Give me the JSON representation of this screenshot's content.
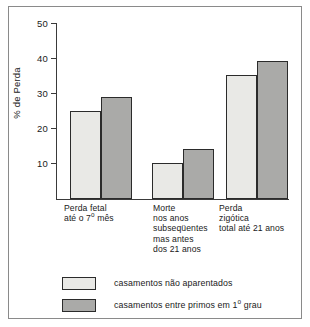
{
  "chart_data": {
    "type": "bar",
    "title": "",
    "subtitle": "",
    "xlabel": "",
    "ylabel": "% de Perda",
    "ylim": [
      0,
      50
    ],
    "yticks": [
      10,
      20,
      30,
      40,
      50
    ],
    "ytick_labels": [
      "10",
      "20",
      "30",
      "40",
      "50"
    ],
    "grid": false,
    "legend_position": "bottom-left",
    "categories": [
      "Perda fetal\naté o 7º mês",
      "Morte\nnos anos\nsubseqüentes\nmas antes\ndos 21 anos",
      "Perda\nzigótica\ntotal até 21 anos"
    ],
    "series": [
      {
        "name": "casamentos não aparentados",
        "color": "#e9e9e6",
        "values": [
          25.1,
          10.1,
          35.4
        ]
      },
      {
        "name": "casamentos entre primos em 1º grau",
        "color": "#aaaaa8",
        "values": [
          29.1,
          14.2,
          39.4
        ]
      }
    ],
    "annotations": []
  },
  "axis": {
    "y_title": "% de Perda",
    "ticks": [
      {
        "label": "50",
        "value": 50
      },
      {
        "label": "40",
        "value": 40
      },
      {
        "label": "30",
        "value": 30
      },
      {
        "label": "20",
        "value": 20
      },
      {
        "label": "10",
        "value": 10
      }
    ]
  },
  "categories": [
    {
      "id": "perda-fetal",
      "label": "Perda fetal\naté o 7º mês"
    },
    {
      "id": "morte-subsequente",
      "label": "Morte\nnos anos\nsubseqüentes\nmas antes\ndos 21 anos"
    },
    {
      "id": "perda-zigotica",
      "label": "Perda\nzigótica\ntotal até 21 anos"
    }
  ],
  "bars": [
    {
      "id": "perda-fetal-nao-aparentados",
      "group": 0,
      "series": 0,
      "value": 25.1,
      "x": 70,
      "width": 31
    },
    {
      "id": "perda-fetal-primos",
      "group": 0,
      "series": 1,
      "value": 29.1,
      "x": 101,
      "width": 31
    },
    {
      "id": "morte-nao-aparentados",
      "group": 1,
      "series": 0,
      "value": 10.1,
      "x": 152,
      "width": 31
    },
    {
      "id": "morte-primos",
      "group": 1,
      "series": 1,
      "value": 14.2,
      "x": 183,
      "width": 31
    },
    {
      "id": "zigotica-nao-aparentados",
      "group": 2,
      "series": 0,
      "value": 35.4,
      "x": 226,
      "width": 31
    },
    {
      "id": "zigotica-primos",
      "group": 2,
      "series": 1,
      "value": 39.4,
      "x": 257,
      "width": 31
    }
  ],
  "legend": {
    "items": [
      {
        "id": "nao-aparentados",
        "label": "casamentos não aparentados",
        "swatch": "light",
        "color": "#e9e9e6"
      },
      {
        "id": "primos-1-grau",
        "label": "casamentos entre primos em 1º grau",
        "swatch": "dark",
        "color": "#aaaaa8"
      }
    ]
  },
  "colors": {
    "series_light": "#e9e9e6",
    "series_dark": "#aaaaa8",
    "outline": "#2b2b2b",
    "axis": "#3a3a3a",
    "frame": "#8a8a8a",
    "text": "#1a1a1a",
    "background": "#ffffff"
  }
}
